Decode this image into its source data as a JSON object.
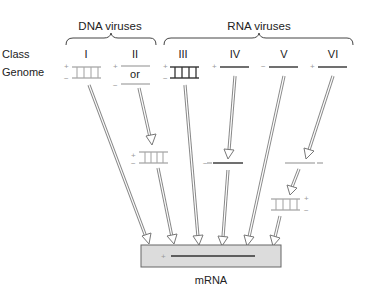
{
  "groups": {
    "dna": {
      "label": "DNA viruses"
    },
    "rna": {
      "label": "RNA viruses"
    }
  },
  "row_labels": {
    "class": "Class",
    "genome": "Genome"
  },
  "classes": [
    {
      "id": "I",
      "label": "I",
      "genome": "double-stranded DNA",
      "signs": [
        "+",
        "−"
      ]
    },
    {
      "id": "II",
      "label": "II",
      "genome": "single-stranded DNA (+ or −)",
      "signs": [
        "+",
        "−"
      ],
      "connector": "or"
    },
    {
      "id": "III",
      "label": "III",
      "genome": "double-stranded RNA",
      "signs": [
        "+",
        "−"
      ]
    },
    {
      "id": "IV",
      "label": "IV",
      "genome": "single-stranded RNA (+)",
      "signs": [
        "+"
      ]
    },
    {
      "id": "V",
      "label": "V",
      "genome": "single-stranded RNA (−)",
      "signs": [
        "−"
      ]
    },
    {
      "id": "VI",
      "label": "VI",
      "genome": "single-stranded RNA (+)",
      "signs": [
        "+"
      ]
    }
  ],
  "intermediates": {
    "class_II_dsDNA": {
      "signs": [
        "+",
        "−"
      ]
    },
    "class_IV_minus_strand": {
      "signs": [
        "−"
      ]
    },
    "class_VI_minus_strand": {
      "signs": [
        "−"
      ]
    },
    "class_VI_dsDNA": {
      "signs": [
        "+",
        "−"
      ]
    }
  },
  "product": {
    "label": "mRNA",
    "sign": "+"
  },
  "colors": {
    "dna_strand": "#a8a8a8",
    "rna_strand": "#333333",
    "arrow": "#888888",
    "mrna_box": "#dcdcdc"
  }
}
